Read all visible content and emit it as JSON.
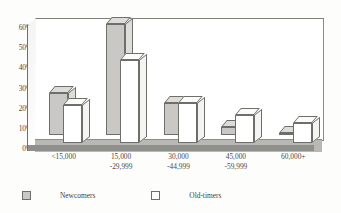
{
  "chart_data": {
    "type": "bar",
    "title": "",
    "subtitle": "",
    "xlabel": "",
    "ylabel": "",
    "ylim": [
      0,
      60
    ],
    "yticks": [
      "0%",
      "10%",
      "20%",
      "30%",
      "40%",
      "50%",
      "60%"
    ],
    "ytick_values": [
      0,
      10,
      20,
      30,
      40,
      50,
      60
    ],
    "grid": false,
    "legend_position": "bottom-left",
    "style": "3d-clustered-column",
    "categories": [
      "<15,000",
      "15,000 -29,999",
      "30,000 -44,999",
      "45,000 -59,999",
      "60,000+"
    ],
    "category_lines": [
      [
        "<15,000",
        ""
      ],
      [
        "15,000",
        "-29,999"
      ],
      [
        "30,000",
        "-44,999"
      ],
      [
        "45,000",
        "-59,999"
      ],
      [
        "60,000+",
        ""
      ]
    ],
    "series": [
      {
        "name": "Newcomers",
        "color": "#c9c8c4",
        "values": [
          21,
          55,
          16,
          4,
          1
        ]
      },
      {
        "name": "Old-timers",
        "color": "#ffffff",
        "values": [
          19,
          41,
          20,
          14,
          10
        ]
      }
    ]
  },
  "legend": {
    "items": [
      {
        "label": "Newcomers",
        "swatch": "shaded"
      },
      {
        "label": "Old-timers",
        "swatch": "white"
      }
    ]
  },
  "colors": {
    "bar_newcomers": "#c9c8c4",
    "bar_oldtimers": "#ffffff",
    "outline": "#6e6e6a",
    "floor": "#b9b8b4",
    "text": "#4a4a4a",
    "background": "#fdfdfc"
  }
}
